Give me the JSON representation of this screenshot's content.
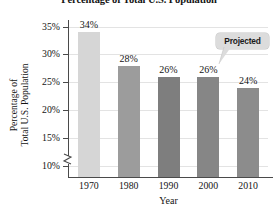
{
  "chart_data": {
    "type": "bar",
    "title": "Percentage of Total U.S. Population",
    "xlabel": "Year",
    "ylabel_line1": "Percentage of",
    "ylabel_line2": "Total U.S. Population",
    "categories": [
      "1970",
      "1980",
      "1990",
      "2000",
      "2010"
    ],
    "values": [
      34,
      28,
      26,
      26,
      24
    ],
    "value_labels": [
      "34%",
      "28%",
      "26%",
      "26%",
      "24%"
    ],
    "bar_colors": [
      "#d6d6d6",
      "#9c9c9c",
      "#7e7e7e",
      "#868686",
      "#8c8c8c"
    ],
    "ylim": [
      8,
      36
    ],
    "yticks": [
      10,
      15,
      20,
      25,
      30,
      35
    ],
    "ytick_labels": [
      "10%",
      "15%",
      "20%",
      "25%",
      "30%",
      "35%"
    ],
    "grid": true,
    "legend": "none",
    "axis_break": true,
    "annotations": [
      {
        "text": "Projected",
        "points_to_category": "2010",
        "style": "rounded-callout"
      }
    ]
  }
}
